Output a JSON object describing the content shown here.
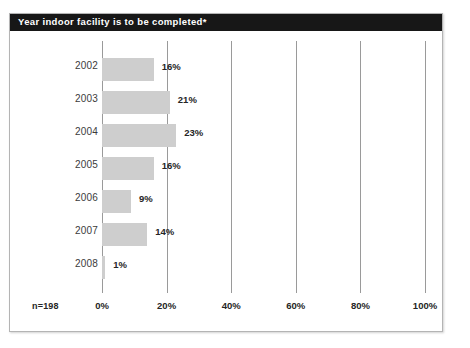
{
  "figure": {
    "title": "Year indoor facility is to be completed*",
    "sample_size_label": "n=198",
    "title_bar_color": "#171717",
    "title_text_color": "#ffffff",
    "bar_color": "#cecece",
    "gridline_color": "#9a9a9a",
    "border_color": "#b4b4b4",
    "background_color": "#ffffff"
  },
  "chart_data": {
    "type": "bar",
    "orientation": "horizontal",
    "title": "Year indoor facility is to be completed*",
    "xlabel": "",
    "ylabel": "",
    "categories": [
      "2002",
      "2003",
      "2004",
      "2005",
      "2006",
      "2007",
      "2008"
    ],
    "values": [
      16,
      21,
      23,
      16,
      9,
      14,
      1
    ],
    "value_labels": [
      "16%",
      "21%",
      "23%",
      "16%",
      "9%",
      "14%",
      "1%"
    ],
    "xlim": [
      0,
      100
    ],
    "xticks": [
      0,
      20,
      40,
      60,
      80,
      100
    ],
    "xtick_labels": [
      "0%",
      "20%",
      "40%",
      "60%",
      "80%",
      "100%"
    ],
    "grid": true,
    "grid_axis": "x",
    "legend": false,
    "annotations": [
      "n=198"
    ]
  }
}
